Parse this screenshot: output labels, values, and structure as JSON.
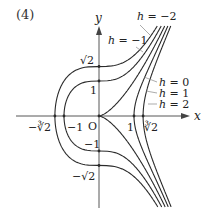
{
  "figure": {
    "panel_label": "(4)",
    "equation": "y^2 = x^3 - h",
    "axes": {
      "x_label": "x",
      "y_label": "y",
      "origin_label": "O"
    },
    "x_ticks": [
      {
        "value": -1.2599,
        "label": "−∛2",
        "side": "below-left"
      },
      {
        "value": -1,
        "label": "−1",
        "side": "below-right"
      },
      {
        "value": 1,
        "label": "1",
        "side": "below-left"
      },
      {
        "value": 1.2599,
        "label": "∛2",
        "side": "below-right"
      }
    ],
    "y_ticks": [
      {
        "value": 1.4142,
        "label": "√2"
      },
      {
        "value": 1,
        "label": "1"
      },
      {
        "value": -1,
        "label": "−1"
      },
      {
        "value": -1.4142,
        "label": "−√2"
      }
    ],
    "curves": [
      {
        "h": -2,
        "label": "h = −2"
      },
      {
        "h": -1,
        "label": "h = −1"
      },
      {
        "h": 0,
        "label": "h = 0"
      },
      {
        "h": 1,
        "label": "h = 1"
      },
      {
        "h": 2,
        "label": "h = 2"
      }
    ],
    "colors": {
      "curve": "#2a2a2a",
      "axis": "#444444",
      "leader": "#888888",
      "text": "#222222"
    }
  }
}
